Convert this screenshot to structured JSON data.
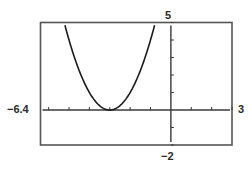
{
  "chart_data": {
    "type": "line",
    "title": "",
    "xlabel": "",
    "ylabel": "",
    "xlim": [
      -6.4,
      3
    ],
    "ylim": [
      -2,
      5
    ],
    "x_scale": 1,
    "y_scale": 1,
    "grid": false,
    "legend": null,
    "window_labels": {
      "xmin": "−6.4",
      "xmax": "3",
      "ymin": "−2",
      "ymax": "5"
    },
    "series": [
      {
        "name": "y = (x + 3)^2",
        "equation": "y = (x + 3)^2",
        "vertex": [
          -3,
          0
        ],
        "x": [
          -5.2,
          -5.0,
          -4.5,
          -4.0,
          -3.5,
          -3.0,
          -2.5,
          -2.0,
          -1.5,
          -1.0,
          -0.8
        ],
        "y": [
          4.84,
          4.0,
          2.25,
          1.0,
          0.25,
          0.0,
          0.25,
          1.0,
          2.25,
          4.0,
          4.84
        ]
      }
    ]
  },
  "colors": {
    "frame": "#3a3a3a",
    "axis": "#3a3a3a",
    "curve": "#1a1a1a",
    "background": "#ffffff"
  }
}
